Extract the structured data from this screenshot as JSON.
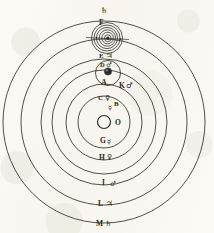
{
  "figure": {
    "ink_color": "#2e2a26",
    "paper_color": "#fbfaf6",
    "center_body": {
      "label": "O",
      "name": "central-sun"
    }
  },
  "orbits": [
    {
      "id": "B",
      "label": "B",
      "symbol": "☿",
      "symbol_name": "mercury-symbol",
      "radius": 26
    },
    {
      "id": "C",
      "label": "C",
      "symbol": "♀",
      "symbol_name": "venus-symbol",
      "radius": 38
    },
    {
      "id": "A",
      "label": "A",
      "symbol": "⊕",
      "symbol_name": "earth-symbol",
      "radius": 53
    },
    {
      "id": "D",
      "label": "D",
      "symbol": "♂",
      "symbol_name": "mars-symbol",
      "radius": 63
    },
    {
      "id": "E",
      "label": "E",
      "symbol": "♃",
      "symbol_name": "jupiter-symbol",
      "radius": 78
    },
    {
      "id": "F",
      "label": "F",
      "symbol": "♄",
      "symbol_name": "saturn-symbol",
      "radius": 101
    }
  ],
  "upper_labels": [
    {
      "id": "saturn-top",
      "label": "",
      "symbol": "♄",
      "symbol_name": "saturn-symbol",
      "y": 12
    },
    {
      "id": "F",
      "label": "F",
      "symbol": "",
      "symbol_name": "none",
      "y": 23
    },
    {
      "id": "E",
      "label": "E",
      "symbol": "♃",
      "symbol_name": "jupiter-symbol",
      "y": 56
    },
    {
      "id": "D",
      "label": "D",
      "symbol": "♂",
      "symbol_name": "mars-symbol",
      "y": 66
    },
    {
      "id": "A",
      "label": "A",
      "symbol": "",
      "symbol_name": "none",
      "y": 83
    },
    {
      "id": "K",
      "label": "K",
      "symbol": "♂",
      "symbol_name": "mars-symbol",
      "y": 86
    },
    {
      "id": "C",
      "label": "C",
      "symbol": "♀",
      "symbol_name": "venus-symbol",
      "y": 98
    },
    {
      "id": "B",
      "label": "B",
      "symbol": "☿",
      "symbol_name": "mercury-symbol",
      "y": 106
    }
  ],
  "lower_labels": [
    {
      "id": "G",
      "label": "G",
      "symbol": "☿",
      "symbol_name": "mercury-symbol",
      "y": 141
    },
    {
      "id": "H",
      "label": "H",
      "symbol": "♀",
      "symbol_name": "venus-symbol",
      "y": 158
    },
    {
      "id": "I",
      "label": "I",
      "symbol": "♂",
      "symbol_name": "mars-symbol",
      "y": 183
    },
    {
      "id": "L",
      "label": "L",
      "symbol": "♃",
      "symbol_name": "jupiter-symbol",
      "y": 204
    },
    {
      "id": "M",
      "label": "M",
      "symbol": "♄",
      "symbol_name": "saturn-symbol",
      "y": 223
    }
  ],
  "satellite_system": {
    "name": "saturn-moon-system",
    "center_x": 107,
    "center_y": 38,
    "ring_radii": [
      3,
      5.5,
      8,
      10.5,
      13,
      15.5
    ],
    "body_label": ""
  },
  "earth_inset": {
    "name": "earth-moon-inset",
    "center_x": 108,
    "center_y": 74,
    "radius": 11,
    "body_radius": 3.4
  },
  "center_disc": {
    "name": "sun-disc",
    "center_x": 104,
    "center_y": 122,
    "radius": 6.5,
    "label": "O"
  }
}
